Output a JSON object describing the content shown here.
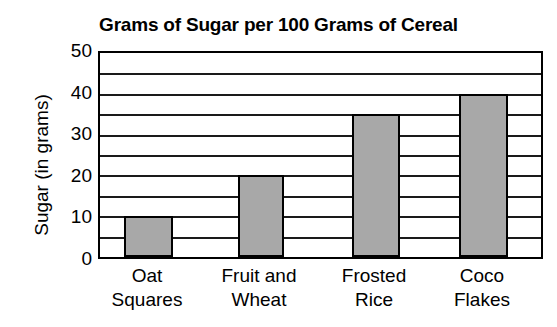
{
  "chart_data": {
    "type": "bar",
    "title": "Grams of Sugar per 100 Grams of Cereal",
    "xlabel": "",
    "ylabel": "Sugar (in grams)",
    "categories": [
      "Oat Squares",
      "Fruit and Wheat",
      "Frosted Rice",
      "Coco Flakes"
    ],
    "category_lines": [
      [
        "Oat",
        "Squares"
      ],
      [
        "Fruit and",
        "Wheat"
      ],
      [
        "Frosted",
        "Rice"
      ],
      [
        "Coco",
        "Flakes"
      ]
    ],
    "values": [
      10,
      20,
      35,
      40
    ],
    "ylim": [
      0,
      50
    ],
    "y_ticks": [
      0,
      10,
      20,
      30,
      40,
      50
    ],
    "y_tick_labels": [
      "0",
      "10",
      "20",
      "30",
      "40",
      "50"
    ],
    "gridline_interval": 5,
    "gridline_values": [
      5,
      10,
      15,
      20,
      25,
      30,
      35,
      40,
      45
    ],
    "grid": true,
    "legend": false,
    "bar_fill_color": "#a8a8a8",
    "bar_border_color": "#000000",
    "axis_color": "#000000",
    "background_color": "#ffffff"
  }
}
